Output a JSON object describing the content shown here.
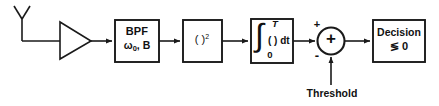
{
  "diagram": {
    "stroke_color": "#1a1a1a",
    "background_color": "#ffffff",
    "signal_path_y": 41
  },
  "antenna": {
    "icon": "antenna-icon",
    "label": ""
  },
  "amplifier": {
    "icon": "amplifier-triangle-icon",
    "label": ""
  },
  "blocks": {
    "bpf": {
      "name": "BPF",
      "params_prefix": "ω",
      "params_sub": "0",
      "params_suffix": ", B"
    },
    "squarer": {
      "base": "( )",
      "exponent": "2"
    },
    "integrator": {
      "integral_sign": "∫",
      "upper_limit": "T",
      "lower_limit": "0",
      "body": "( ) dt"
    },
    "decision": {
      "line1": "Decision",
      "line2": "≶ 0"
    }
  },
  "summer": {
    "inside_symbol": "+",
    "input_top_sign": "+",
    "input_bottom_sign": "-"
  },
  "threshold": {
    "label": "Threshold"
  }
}
